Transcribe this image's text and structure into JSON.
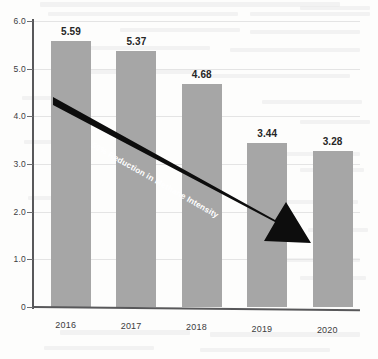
{
  "chart_data": {
    "type": "bar",
    "title": "",
    "xlabel": "",
    "ylabel": "",
    "categories": [
      "2016",
      "2017",
      "2018",
      "2019",
      "2020"
    ],
    "values": [
      5.59,
      5.37,
      4.68,
      3.44,
      3.28
    ],
    "value_labels": [
      "5.59",
      "5.37",
      "4.68",
      "3.44",
      "3.28"
    ],
    "ylim": [
      0,
      6.0
    ],
    "y_ticks": [
      0,
      1.0,
      2.0,
      3.0,
      4.0,
      5.0,
      6.0
    ],
    "y_tick_labels": [
      "0",
      "1.0",
      "2.0",
      "3.0",
      "4.0",
      "5.0",
      "6.0"
    ],
    "grid": true,
    "legend": "none",
    "annotations": [
      {
        "text": "59% Reduction in Methane Intensity",
        "type": "arrow",
        "direction": "down-right"
      }
    ],
    "colors": {
      "bar": "#a6a6a6",
      "arrow": "#0d0d0d",
      "annotation_text": "#ffffff",
      "axis": "#58585a",
      "gridline": "#e4e4e4",
      "value_label": "#262626",
      "background": "#fdfdfc"
    }
  }
}
